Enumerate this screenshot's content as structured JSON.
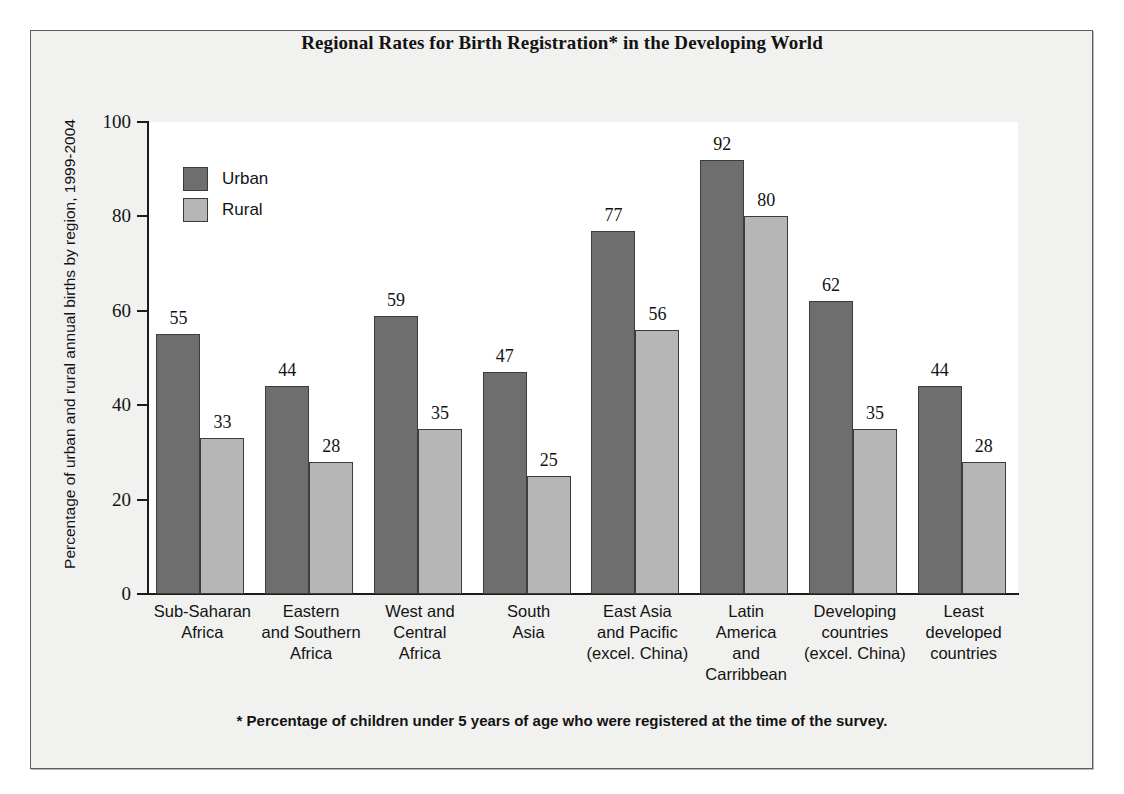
{
  "figure": {
    "title": "Regional Rates for Birth Registration* in the Developing World",
    "footnote": "* Percentage of children under 5 years of age who were registered at the time of the survey."
  },
  "colors": {
    "urban": "#6e6e6e",
    "rural": "#b6b6b6",
    "axis": "#1b1b1b",
    "page": "#f1f1ef",
    "plot_background": "#ffffff",
    "text": "#131313"
  },
  "legend": {
    "position": "top-left-inside",
    "entries": [
      {
        "label": "Urban",
        "color": "#6e6e6e"
      },
      {
        "label": "Rural",
        "color": "#b6b6b6"
      }
    ]
  },
  "chart_data": {
    "type": "bar",
    "title": "Regional Rates for Birth Registration* in the Developing World",
    "xlabel": "",
    "ylabel": "Percentage of urban and rural annual births by region, 1999-2004",
    "ylim": [
      0,
      100
    ],
    "yticks": [
      0,
      20,
      40,
      60,
      80,
      100
    ],
    "grid": false,
    "legend_position": "top-left-inside",
    "annotations": [
      "* Percentage of children under 5 years of age who were registered at the time of the survey."
    ],
    "categories": [
      "Sub-Saharan\nAfrica",
      "Eastern\nand Southern\nAfrica",
      "West and\nCentral\nAfrica",
      "South\nAsia",
      "East Asia\nand Pacific\n(excel. China)",
      "Latin\nAmerica\nand\nCarribbean",
      "Developing\ncountries\n(excel. China)",
      "Least\ndeveloped\ncountries"
    ],
    "series": [
      {
        "name": "Urban",
        "color": "#6e6e6e",
        "values": [
          55,
          44,
          59,
          47,
          77,
          92,
          62,
          44
        ]
      },
      {
        "name": "Rural",
        "color": "#b6b6b6",
        "values": [
          33,
          28,
          35,
          25,
          56,
          80,
          35,
          28
        ]
      }
    ]
  },
  "axis": {
    "y_tick_labels": [
      "0",
      "20",
      "40",
      "60",
      "80",
      "100"
    ]
  }
}
